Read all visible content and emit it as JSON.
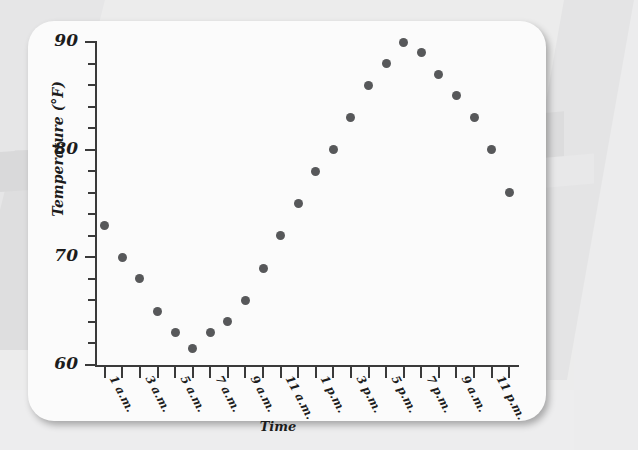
{
  "chart_data": {
    "type": "scatter",
    "title": "",
    "xlabel": "Time",
    "ylabel": "Temperature (°F)",
    "ylim": [
      60,
      90
    ],
    "y_major_ticks": [
      60,
      70,
      80,
      90
    ],
    "y_major_tick_labels": [
      "60",
      "70",
      "80",
      "90"
    ],
    "y_minor_tick_step": 2,
    "grid": false,
    "legend": null,
    "x_tick_count": 24,
    "x": [
      "12 a.m.",
      "1 a.m.",
      "2 a.m.",
      "3 a.m.",
      "4 a.m.",
      "5 a.m.",
      "6 a.m.",
      "7 a.m.",
      "8 a.m.",
      "9 a.m.",
      "10 a.m.",
      "11 a.m.",
      "12 p.m.",
      "1 p.m.",
      "2 p.m.",
      "3 p.m.",
      "4 p.m.",
      "5 p.m.",
      "6 p.m.",
      "7 p.m.",
      "8 p.m.",
      "9 p.m.",
      "10 p.m.",
      "11 p.m."
    ],
    "x_tick_labels": [
      {
        "index": 1,
        "label": "1 a.m."
      },
      {
        "index": 3,
        "label": "3 a.m."
      },
      {
        "index": 5,
        "label": "5 a.m."
      },
      {
        "index": 7,
        "label": "7 a.m."
      },
      {
        "index": 9,
        "label": "9 a.m."
      },
      {
        "index": 11,
        "label": "11 a.m."
      },
      {
        "index": 13,
        "label": "1 p.m."
      },
      {
        "index": 15,
        "label": "3 p.m."
      },
      {
        "index": 17,
        "label": "5 p.m."
      },
      {
        "index": 19,
        "label": "7 p.m."
      },
      {
        "index": 21,
        "label": "9 a.m."
      },
      {
        "index": 23,
        "label": "11 p.m."
      }
    ],
    "values": [
      73,
      70,
      68,
      65,
      63,
      61.5,
      63,
      64,
      66,
      69,
      72,
      75,
      78,
      80,
      83,
      86,
      88,
      90,
      89,
      87,
      85,
      83,
      80,
      76
    ],
    "marker_color": "#57585a",
    "axis_color": "#3a3a3a",
    "plot_background": "#fbfbfb"
  }
}
